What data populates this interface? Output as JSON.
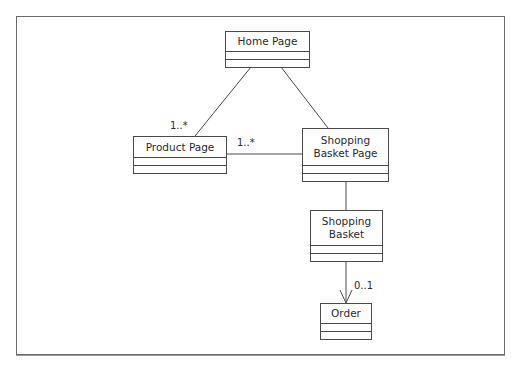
{
  "diagram": {
    "type": "UML class diagram",
    "classes": [
      {
        "id": "home",
        "name": "Home Page"
      },
      {
        "id": "product",
        "name": "Product Page"
      },
      {
        "id": "basket_page",
        "name": "Shopping Basket Page"
      },
      {
        "id": "basket",
        "name": "Shopping Basket"
      },
      {
        "id": "order",
        "name": "Order"
      }
    ],
    "associations": [
      {
        "from": "Home Page",
        "to": "Product Page",
        "multiplicity": "1..*"
      },
      {
        "from": "Home Page",
        "to": "Shopping Basket Page",
        "multiplicity": ""
      },
      {
        "from": "Shopping Basket Page",
        "to": "Product Page",
        "multiplicity": "1..*"
      },
      {
        "from": "Shopping Basket Page",
        "to": "Shopping Basket",
        "multiplicity": ""
      },
      {
        "from": "Shopping Basket",
        "to": "Order",
        "multiplicity": "0..1",
        "navigable": true
      }
    ],
    "labels": {
      "home": "Home Page",
      "product": "Product Page",
      "basket_page_l1": "Shopping",
      "basket_page_l2": "Basket Page",
      "basket_l1": "Shopping",
      "basket_l2": "Basket",
      "order": "Order",
      "mult_home_product": "1..*",
      "mult_basketpage_product": "1..*",
      "mult_basket_order": "0..1"
    },
    "colors": {
      "line": "#4a4a4a",
      "text": "#2a2a2a",
      "background": "#ffffff"
    }
  }
}
